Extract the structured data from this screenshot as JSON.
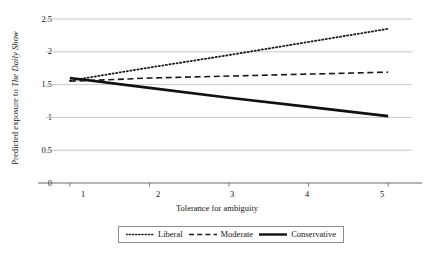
{
  "chart_data": {
    "type": "line",
    "title": "",
    "xlabel": "Tolerance for ambiguity",
    "ylabel": "Predicted exposure to The Daily Show",
    "ylabel_plain": "Predicted exposure to ",
    "ylabel_italic": "The Daily Show",
    "x": [
      1,
      2,
      3,
      4,
      5
    ],
    "xlim": [
      0.7,
      5.3
    ],
    "ylim": [
      0,
      2.5
    ],
    "xticks": [
      "1",
      "2",
      "3",
      "4",
      "5"
    ],
    "yticks": [
      "0",
      "0.5",
      "1",
      "1.5",
      "2",
      "2.5"
    ],
    "ytick_values": [
      0,
      0.5,
      1,
      1.5,
      2,
      2.5
    ],
    "grid": true,
    "grid_axis": "y",
    "legend_position": "bottom-center",
    "series": [
      {
        "name": "Liberal",
        "style": "dotted",
        "color": "#1a1a1a",
        "values": [
          1.56,
          1.76,
          1.95,
          2.15,
          2.35
        ]
      },
      {
        "name": "Moderate",
        "style": "dashed",
        "color": "#1a1a1a",
        "values": [
          1.55,
          1.6,
          1.63,
          1.66,
          1.69
        ]
      },
      {
        "name": "Conservative",
        "style": "solid",
        "color": "#111111",
        "values": [
          1.6,
          1.45,
          1.3,
          1.16,
          1.02
        ]
      }
    ]
  },
  "legend": {
    "items": [
      {
        "label": "Liberal",
        "style": "dotted"
      },
      {
        "label": "Moderate",
        "style": "dashed"
      },
      {
        "label": "Conservative",
        "style": "solid"
      }
    ]
  },
  "colors": {
    "axis": "#6b6b6b",
    "grid": "#b9b9b9",
    "ink": "#141414",
    "legend_border": "#8d8d8d",
    "background": "#ffffff"
  }
}
